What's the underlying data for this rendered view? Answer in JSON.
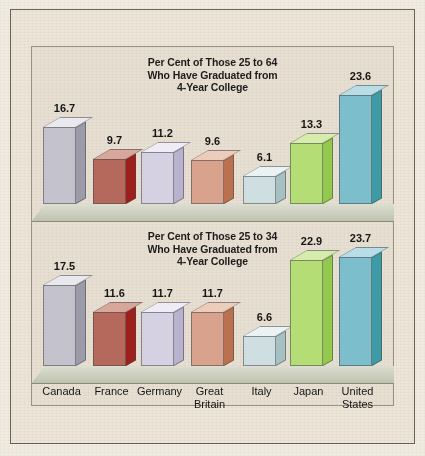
{
  "figure": {
    "background_color": "#ece5d8",
    "panel_background_color": "#e7e0d2",
    "floor_color": "#c9cdb8",
    "border_color": "#6a6258"
  },
  "chart_data": [
    {
      "type": "bar",
      "panel": "top",
      "title": "Per Cent of Those 25 to 64 Who Have Graduated from 4-Year College",
      "title_lines": [
        "Per Cent of Those 25 to 64",
        "Who Have Graduated from",
        "4-Year College"
      ],
      "xlabel": "",
      "ylabel": "",
      "ylim": [
        0,
        26
      ],
      "grid": false,
      "legend": "none",
      "categories": [
        "Canada",
        "France",
        "Germany",
        "Great Britain",
        "Italy",
        "Japan",
        "United States"
      ],
      "values": [
        16.7,
        9.7,
        11.2,
        9.6,
        6.1,
        13.3,
        23.6
      ],
      "value_labels": [
        "16.7",
        "9.7",
        "11.2",
        "9.6",
        "6.1",
        "13.3",
        "23.6"
      ]
    },
    {
      "type": "bar",
      "panel": "bottom",
      "title": "Per Cent of Those 25 to 34 Who Have Graduated from 4-Year College",
      "title_lines": [
        "Per Cent of Those 25 to 34",
        "Who Have Graduated from",
        "4-Year College"
      ],
      "xlabel": "",
      "ylabel": "",
      "ylim": [
        0,
        26
      ],
      "grid": false,
      "legend": "none",
      "categories": [
        "Canada",
        "France",
        "Germany",
        "Great Britain",
        "Italy",
        "Japan",
        "United States"
      ],
      "values": [
        17.5,
        11.6,
        11.7,
        11.7,
        6.6,
        22.9,
        23.7
      ],
      "value_labels": [
        "17.5",
        "11.6",
        "11.7",
        "11.7",
        "6.6",
        "22.9",
        "23.7"
      ]
    }
  ],
  "category_labels": [
    {
      "lines": [
        "Canada"
      ]
    },
    {
      "lines": [
        "France"
      ]
    },
    {
      "lines": [
        "Germany"
      ]
    },
    {
      "lines": [
        "Great",
        "Britain"
      ]
    },
    {
      "lines": [
        "Italy"
      ]
    },
    {
      "lines": [
        "Japan"
      ]
    },
    {
      "lines": [
        "United",
        "States"
      ]
    }
  ],
  "series_colors": [
    {
      "name": "Canada",
      "front": "#c3c2cd",
      "top": "#e8e8ee",
      "side": "#9c9ba9"
    },
    {
      "name": "France",
      "front": "#b5685c",
      "top": "#d8a79c",
      "side": "#9c1f1c"
    },
    {
      "name": "Germany",
      "front": "#d6d1e2",
      "top": "#efecf6",
      "side": "#b9b2ce"
    },
    {
      "name": "Great Britain",
      "front": "#d9a28c",
      "top": "#ecccbb",
      "side": "#b9714f"
    },
    {
      "name": "Italy",
      "front": "#cfdee0",
      "top": "#eaf2f3",
      "side": "#a7c0c4"
    },
    {
      "name": "Japan",
      "front": "#b4dd76",
      "top": "#d5ecad",
      "side": "#93c84e"
    },
    {
      "name": "United States",
      "front": "#7dbecd",
      "top": "#b9dde6",
      "side": "#3e9ba6"
    }
  ]
}
